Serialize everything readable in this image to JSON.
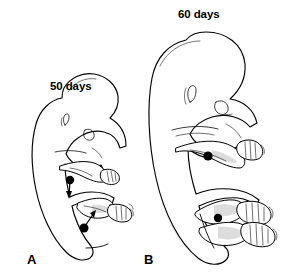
{
  "figure": {
    "kind": "scientific-line-illustration",
    "background_color": "#ffffff",
    "line_color": "#000000",
    "marker_color": "#000000",
    "panels": [
      {
        "letter": "A",
        "age_label": "50 days",
        "markers": [
          {
            "name": "elbow-marker",
            "type": "filled-dot-with-arrow",
            "arrow_direction": "down"
          },
          {
            "name": "knee-marker",
            "type": "filled-dot-with-arrow",
            "arrow_direction": "up-right"
          }
        ],
        "features": [
          "head",
          "ear",
          "eye",
          "trunk",
          "arm",
          "hand",
          "leg",
          "foot",
          "digital-rays"
        ]
      },
      {
        "letter": "B",
        "age_label": "60 days",
        "markers": [
          {
            "name": "elbow-marker",
            "type": "filled-dot",
            "arrow_direction": "none"
          },
          {
            "name": "knee-marker",
            "type": "filled-dot",
            "arrow_direction": "none"
          }
        ],
        "features": [
          "head",
          "ear",
          "eye",
          "trunk",
          "arm",
          "hand",
          "fingers",
          "legs",
          "feet",
          "toes"
        ]
      }
    ]
  }
}
